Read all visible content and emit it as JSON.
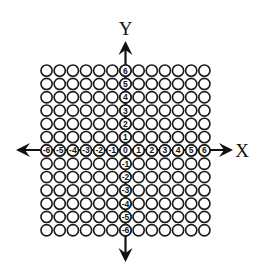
{
  "diagram": {
    "axis_labels": {
      "x": "X",
      "y": "Y"
    },
    "grid": {
      "columns": 13,
      "rows": 13,
      "origin_px": {
        "left": 40,
        "top": 64
      },
      "pitch_px": {
        "x": 13.15,
        "y": 13.3
      },
      "circle_radius_px": 5.6,
      "stroke_color": "#1a1a1a",
      "fill_color": "#ffffff"
    },
    "x_tick_labels": [
      "-6",
      "-5",
      "-4",
      "-3",
      "-2",
      "-1",
      "0",
      "1",
      "2",
      "3",
      "4",
      "5",
      "6"
    ],
    "y_tick_labels_top_to_bottom": [
      "6",
      "5",
      "4",
      "3",
      "2",
      "1",
      "0",
      "-1",
      "-2",
      "-3",
      "-4",
      "-5",
      "-6"
    ],
    "axes": {
      "x": {
        "from_px": 16,
        "to_px": 233,
        "y_px": 150
      },
      "y": {
        "from_px": 41,
        "to_px": 262,
        "x_px": 125.5
      },
      "color": "#111111"
    },
    "label_positions": {
      "x_label": {
        "x": 242,
        "y": 157
      },
      "y_label": {
        "x": 125.5,
        "y": 35
      }
    }
  }
}
